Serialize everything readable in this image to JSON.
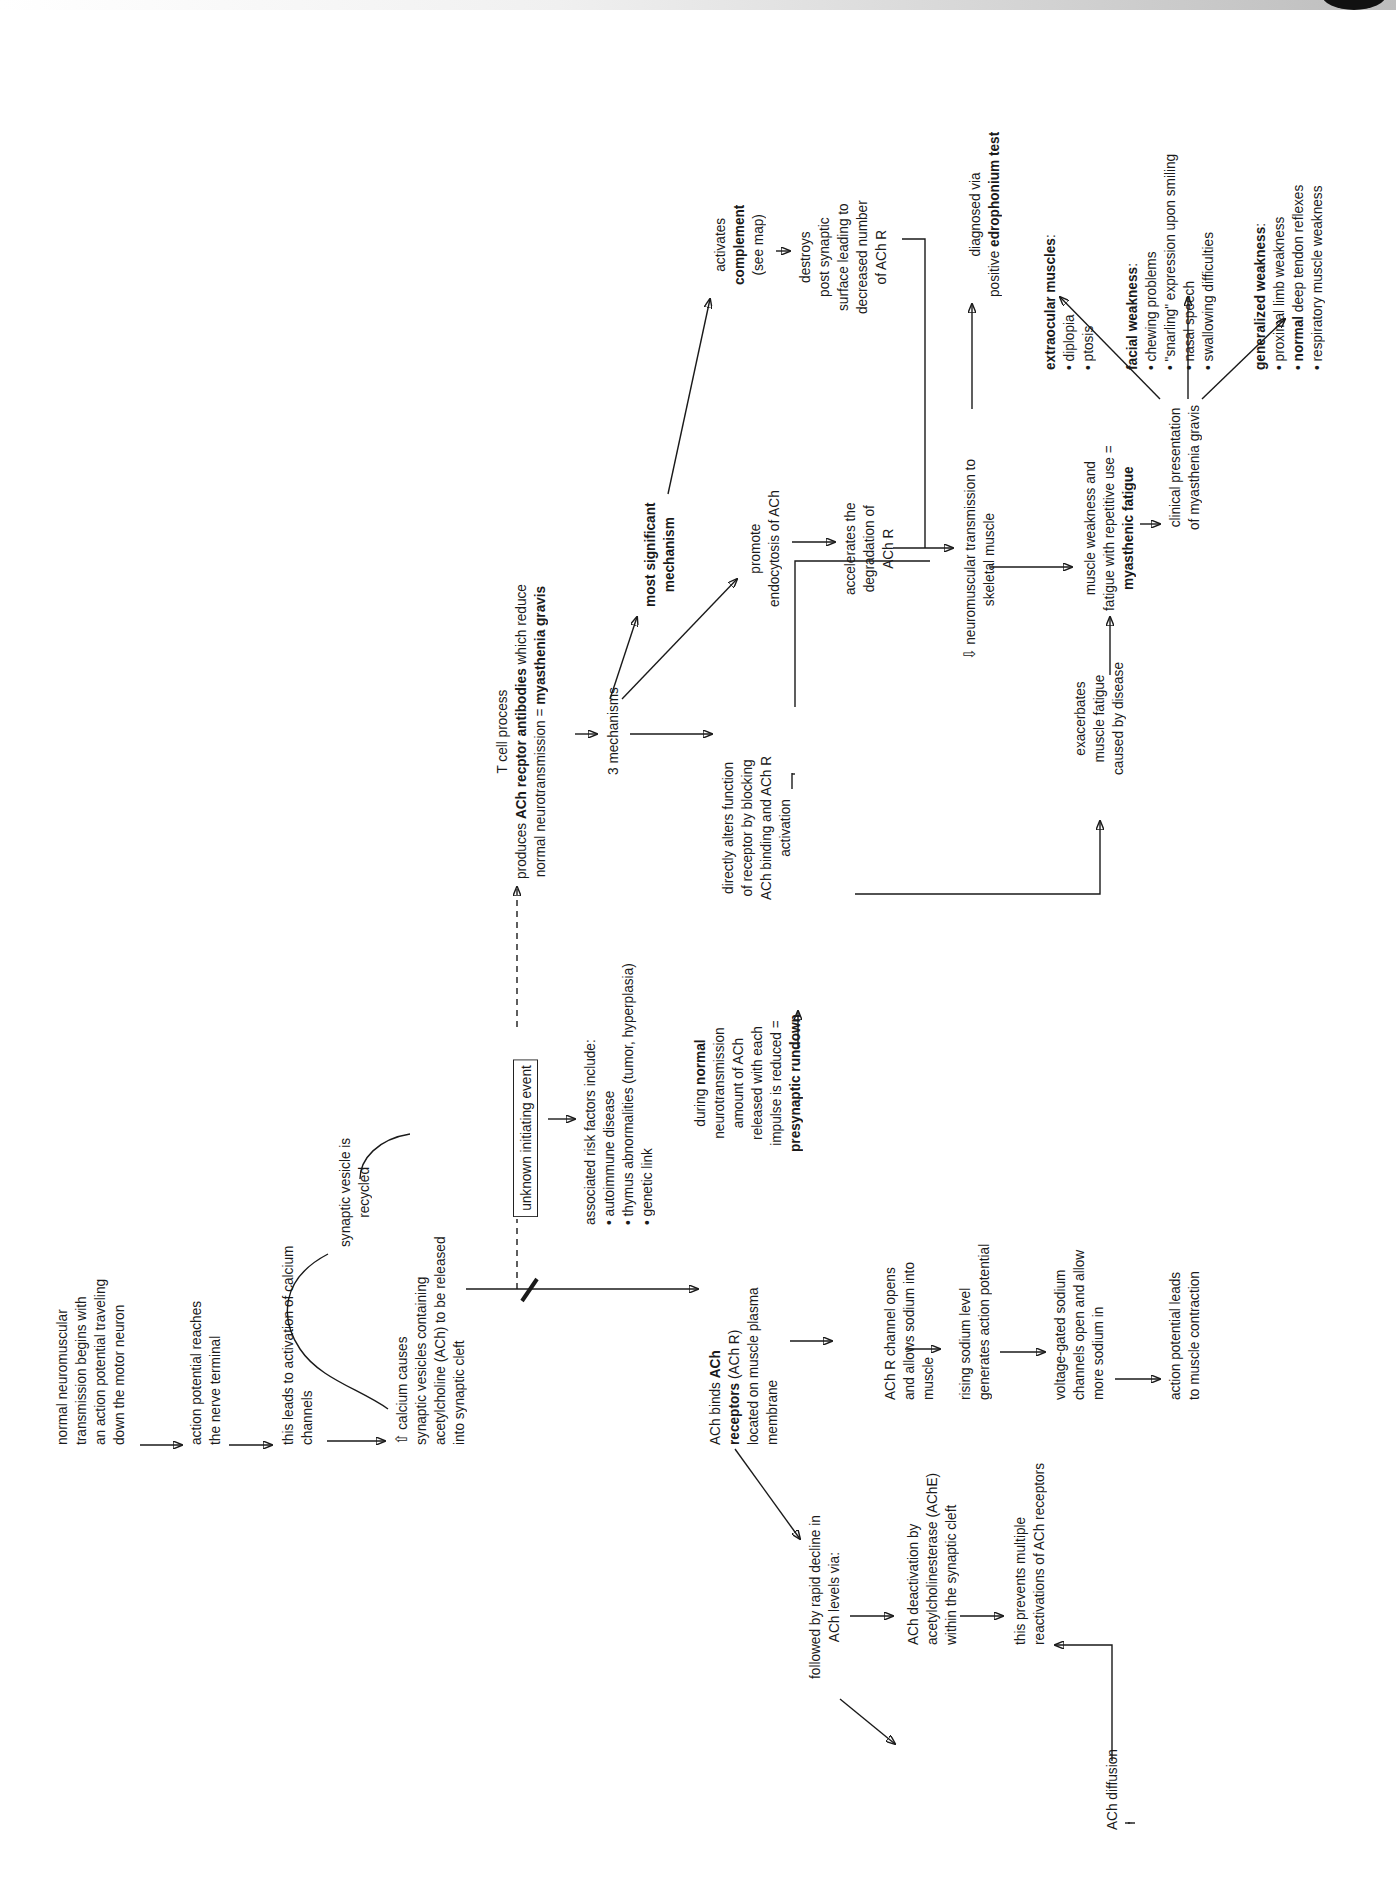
{
  "page": {
    "orientation": "rotated 90 degrees counter-clockwise",
    "accent_colors": {
      "ink": "#1a1a1a",
      "background": "#ffffff"
    }
  },
  "nodes": {
    "start": [
      "normal neuromuscular",
      "transmission begins with",
      "an action potential traveling",
      "down the motor neuron"
    ],
    "ap_reaches": [
      "action potential reaches",
      "the nerve terminal"
    ],
    "calcium_channels": [
      "this leads to activation of calcium",
      "channels"
    ],
    "calcium_causes": {
      "icon": "up-arrow-outline",
      "lines": [
        "calcium causes",
        "synaptic vesicles containing",
        "acetylcholine (ACh) to be released",
        "into synaptic cleft"
      ]
    },
    "vesicle_recycled": [
      "synaptic vesicle is",
      "recycled"
    ],
    "ach_binds": {
      "pre": "ACh binds ",
      "bold1": "ACh",
      "bold2": "receptors",
      "post2": " (ACh R)",
      "lines": [
        "located on muscle plasma",
        "membrane"
      ]
    },
    "rapid_decline": [
      "followed by rapid decline in",
      "ACh levels via:"
    ],
    "deactivation": [
      "ACh deactivation by",
      "acetylcholinesterase (AChE)",
      "within the synaptic cleft"
    ],
    "prevents": [
      "this prevents multiple",
      "reactivations of ACh receptors"
    ],
    "diffusion": "ACh diffusion",
    "channel_opens": [
      "ACh R channel opens",
      "and allows sodium into",
      "muscle"
    ],
    "rising_sodium": [
      "rising sodium level",
      "generates action potential"
    ],
    "voltage_gated": [
      "voltage-gated sodium",
      "channels open and allow",
      "more sodium in"
    ],
    "contraction": [
      "action potential leads",
      "to muscle contraction"
    ],
    "unknown_event": "unknown initiating event",
    "risk_factors": {
      "title": "associated risk factors include:",
      "items": [
        "autoimmune disease",
        "thymus abnormalities (tumor, hyperplasia)",
        "genetic link"
      ]
    },
    "presynaptic": {
      "l1_pre": "during ",
      "l1_bold": "normal",
      "lines": [
        "neurotransmission",
        "amount of ACh",
        "released with each",
        "impulse is reduced ="
      ],
      "bold_last": "presynaptic rundown"
    },
    "tcell": {
      "l1": "T cell process",
      "l2_pre": "produces ",
      "l2_bold": "ACh recptor antibodies",
      "l2_post": " which reduce",
      "l3_pre": "normal neurotransmission = ",
      "l3_bold": "myasthenia gravis"
    },
    "three_mech": "3 mechanisms",
    "directly_alters": [
      "directly alters function",
      "of receptor by blocking",
      "ACh binding and ACh R",
      "activation"
    ],
    "most_significant": [
      "most significant",
      "mechanism"
    ],
    "endocytosis": [
      "promote",
      "endocytosis of ACh"
    ],
    "degradation": [
      "accelerates the",
      "degradation of",
      "ACh R"
    ],
    "complement": {
      "l1": "activates",
      "bold": "complement",
      "l3": "(see map)"
    },
    "destroys": [
      "destroys",
      "post synaptic",
      "surface leading to",
      "decreased number",
      "of ACh R"
    ],
    "reduced_nmt": {
      "icon": "down-arrow-outline",
      "lines": [
        "neuromuscular transmission to",
        "skeletal muscle"
      ]
    },
    "diagnosed": {
      "l1": "diagnosed via",
      "l2_pre": "positive ",
      "l2_bold": "edrophonium test"
    },
    "exacerbates": [
      "exacerbates",
      "muscle fatigue",
      "caused by disease"
    ],
    "weakness": {
      "lines": [
        "muscle weakness and",
        "fatigue with repetitive use ="
      ],
      "bold": "myasthenic fatigue"
    },
    "clinical": [
      "clinical presentation",
      "of myasthenia gravis"
    ],
    "extraocular": {
      "title": "extraocular muscles",
      "items": [
        "diplopia",
        "ptosis"
      ]
    },
    "facial": {
      "title": "facial weakness",
      "items": [
        "chewing problems",
        "\"snarling\" expression upon smiling",
        "nasal speech",
        "swallowing difficulties"
      ]
    },
    "generalized": {
      "title": "generalized weakness",
      "items": [
        "proximal limb weakness",
        "deep tendon reflexes",
        "respiratory muscle weakness"
      ],
      "item2_bold": "normal"
    }
  },
  "glyphs": {
    "bullet": "•",
    "up_outline": "⇧",
    "down_outline": "⇩",
    "colon": ":"
  }
}
